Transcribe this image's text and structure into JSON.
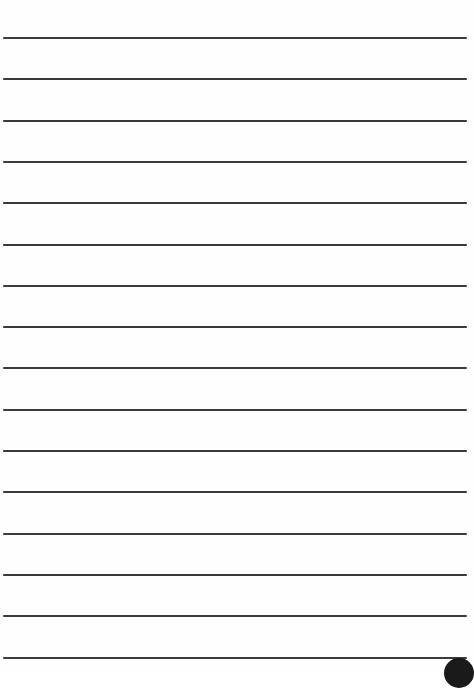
{
  "document": {
    "type": "lined paper",
    "line_color": "#3a3a3a",
    "background": "#fefefe",
    "line_count": 16,
    "first_line_y": 37,
    "line_spacing": 41.3,
    "text_content": ""
  }
}
